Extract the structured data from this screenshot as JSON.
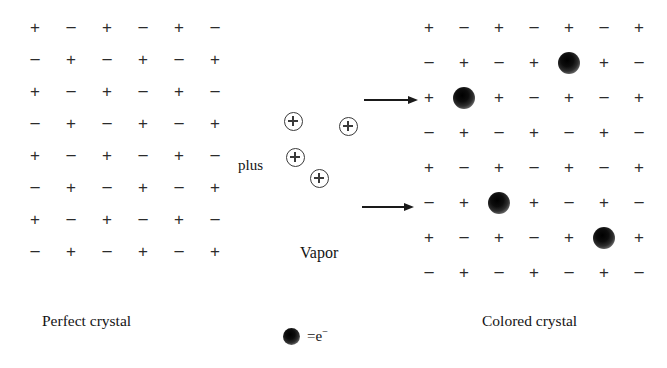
{
  "figure": {
    "background_color": "#ffffff",
    "ink_color": "#1a1a1a"
  },
  "left_crystal": {
    "caption": "Perfect crystal",
    "origin_x": 35,
    "origin_y": 28,
    "col_spacing": 36,
    "row_spacing": 32,
    "cols": 6,
    "rows": 8,
    "grid": [
      [
        "+",
        "−",
        "+",
        "−",
        "+",
        "−"
      ],
      [
        "−",
        "+",
        "−",
        "+",
        "−",
        "+"
      ],
      [
        "+",
        "−",
        "+",
        "−",
        "+",
        "−"
      ],
      [
        "−",
        "+",
        "−",
        "+",
        "−",
        "+"
      ],
      [
        "+",
        "−",
        "+",
        "−",
        "+",
        "−"
      ],
      [
        "−",
        "+",
        "−",
        "+",
        "−",
        "+"
      ],
      [
        "+",
        "−",
        "+",
        "−",
        "+",
        "−"
      ],
      [
        "−",
        "+",
        "−",
        "+",
        "−",
        "+"
      ]
    ]
  },
  "right_crystal": {
    "caption": "Colored crystal",
    "origin_x": 429,
    "origin_y": 28,
    "col_spacing": 35,
    "row_spacing": 35,
    "cols": 7,
    "rows": 8,
    "grid": [
      [
        "+",
        "−",
        "+",
        "−",
        "+",
        "−",
        "+"
      ],
      [
        "−",
        "+",
        "−",
        "+",
        "e",
        "+",
        "−"
      ],
      [
        "+",
        "e",
        "+",
        "−",
        "+",
        "−",
        "+"
      ],
      [
        "−",
        "+",
        "−",
        "+",
        "−",
        "+",
        "−"
      ],
      [
        "+",
        "−",
        "+",
        "−",
        "+",
        "−",
        "+"
      ],
      [
        "−",
        "+",
        "e",
        "+",
        "−",
        "+",
        "−"
      ],
      [
        "+",
        "−",
        "+",
        "−",
        "+",
        "e",
        "+"
      ],
      [
        "−",
        "+",
        "−",
        "+",
        "−",
        "+",
        "−"
      ]
    ],
    "electron_sites": [
      {
        "row": 2,
        "col": 5
      },
      {
        "row": 3,
        "col": 2
      },
      {
        "row": 6,
        "col": 3
      },
      {
        "row": 7,
        "col": 6
      }
    ]
  },
  "vapor": {
    "plus_word": "plus",
    "plus_word_x": 238,
    "plus_word_y": 157,
    "vapor_label": "Vapor",
    "vapor_label_x": 300,
    "vapor_label_y": 244,
    "ion_symbol": "⊕",
    "ions": [
      {
        "x": 293,
        "y": 121
      },
      {
        "x": 348,
        "y": 126
      },
      {
        "x": 295,
        "y": 157
      },
      {
        "x": 319,
        "y": 178
      }
    ]
  },
  "arrows": [
    {
      "x": 364,
      "y": 94,
      "length": 54
    },
    {
      "x": 362,
      "y": 201,
      "length": 52
    }
  ],
  "legend": {
    "dot_x": 291,
    "dot_y": 336,
    "equals": "=",
    "symbol": "e",
    "charge": "−",
    "text": "= e⁻"
  },
  "captions": {
    "left_x": 42,
    "left_y": 312,
    "right_x": 482,
    "right_y": 312
  }
}
